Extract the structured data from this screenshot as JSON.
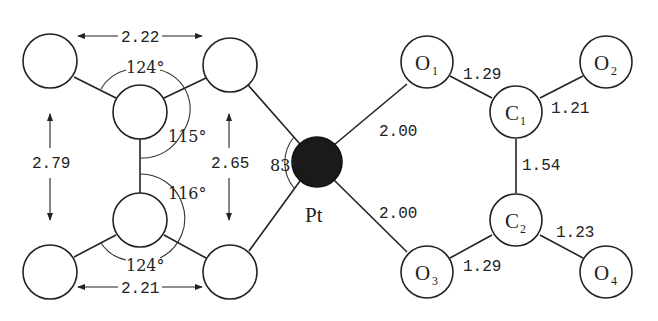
{
  "diagram": {
    "metal": {
      "symbol": "Pt"
    },
    "ligand_left": {
      "distances": {
        "top": "2.22",
        "bottom": "2.21",
        "left_vertical": "2.79",
        "right_vertical": "2.65"
      },
      "angles": {
        "top_outer": "124°",
        "top_inner": "115°",
        "bottom_inner": "116°",
        "bottom_outer": "124°",
        "bite": "83°"
      }
    },
    "ligand_right": {
      "atoms": [
        {
          "id": "O1",
          "element": "O",
          "index": "1"
        },
        {
          "id": "O2",
          "element": "O",
          "index": "2"
        },
        {
          "id": "O3",
          "element": "O",
          "index": "3"
        },
        {
          "id": "O4",
          "element": "O",
          "index": "4"
        },
        {
          "id": "C1",
          "element": "C",
          "index": "1"
        },
        {
          "id": "C2",
          "element": "C",
          "index": "2"
        }
      ],
      "bond_lengths": {
        "Pt_O1": "2.00",
        "Pt_O3": "2.00",
        "O1_C1": "1.29",
        "C1_O2": "1.21",
        "C1_C2": "1.54",
        "C2_O3": "1.29",
        "C2_O4": "1.23"
      }
    }
  }
}
